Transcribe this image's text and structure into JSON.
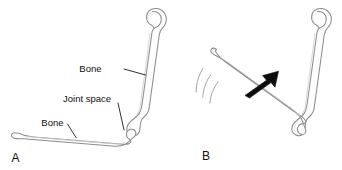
{
  "figure": {
    "background_color": "#ffffff",
    "outline_color": "#8d8d8d",
    "label_color": "#111111",
    "arrow_color": "#0d0d0d",
    "motion_line_color": "#9a9a9a"
  },
  "panels": [
    {
      "id": "A",
      "letter": "A",
      "description": "Two bones meeting at a joint, limb extended",
      "labels": [
        {
          "id": "bone-upper",
          "text": "Bone"
        },
        {
          "id": "joint-space",
          "text": "Joint space"
        },
        {
          "id": "bone-lower",
          "text": "Bone"
        }
      ]
    },
    {
      "id": "B",
      "letter": "B",
      "description": "Same joint flexed, with motion arrow and motion arcs",
      "labels": [],
      "motion": {
        "arrow": "up-right-arrow",
        "arc_count": 3
      }
    }
  ]
}
